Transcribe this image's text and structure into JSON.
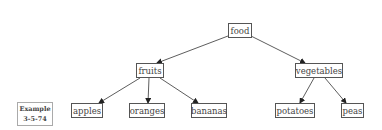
{
  "diagram": {
    "type": "tree",
    "root": "food",
    "nodes": {
      "food": "food",
      "fruits": "fruits",
      "vegetables": "vegetables",
      "apples": "apples",
      "oranges": "oranges",
      "bananas": "bananas",
      "potatoes": "potatoes",
      "peas": "peas"
    },
    "edges": [
      {
        "from": "food",
        "to": "fruits"
      },
      {
        "from": "food",
        "to": "vegetables"
      },
      {
        "from": "fruits",
        "to": "apples"
      },
      {
        "from": "fruits",
        "to": "oranges"
      },
      {
        "from": "fruits",
        "to": "bananas"
      },
      {
        "from": "vegetables",
        "to": "potatoes"
      },
      {
        "from": "vegetables",
        "to": "peas"
      }
    ]
  },
  "example_label": {
    "line1": "Example",
    "line2": "3-5-74"
  }
}
